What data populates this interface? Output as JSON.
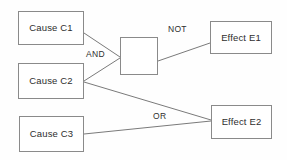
{
  "diagram": {
    "kind": "cause-effect-logic-diagram",
    "background_color": "#fefefe",
    "node_border_color": "#8a8a8a",
    "node_fill_color": "#ffffff",
    "edge_color": "#7a7a7a",
    "text_color": "#2e2e2e",
    "nodes": [
      {
        "id": "c1",
        "label": "Cause C1",
        "role": "cause",
        "x": 18,
        "y": 11,
        "w": 66,
        "h": 34
      },
      {
        "id": "c2",
        "label": "Cause C2",
        "role": "cause",
        "x": 18,
        "y": 63,
        "w": 66,
        "h": 36
      },
      {
        "id": "c3",
        "label": "Cause C3",
        "role": "cause",
        "x": 19,
        "y": 116,
        "w": 65,
        "h": 36
      },
      {
        "id": "gate",
        "label": "",
        "role": "gate",
        "x": 120,
        "y": 37,
        "w": 38,
        "h": 38
      },
      {
        "id": "e1",
        "label": "Effect E1",
        "role": "effect",
        "x": 210,
        "y": 21,
        "w": 62,
        "h": 33
      },
      {
        "id": "e2",
        "label": "Effect E2",
        "role": "effect",
        "x": 211,
        "y": 105,
        "w": 61,
        "h": 34
      }
    ],
    "edges": [
      {
        "id": "c1-gate",
        "from": "c1",
        "to": "gate",
        "x1": 84,
        "y1": 33,
        "x2": 120,
        "y2": 57
      },
      {
        "id": "c2-gate",
        "from": "c2",
        "to": "gate",
        "x1": 84,
        "y1": 81,
        "x2": 120,
        "y2": 58
      },
      {
        "id": "gate-e1",
        "from": "gate",
        "to": "e1",
        "x1": 158,
        "y1": 61,
        "x2": 210,
        "y2": 43
      },
      {
        "id": "c2-e2",
        "from": "c2",
        "to": "e2",
        "x1": 84,
        "y1": 82,
        "x2": 211,
        "y2": 120
      },
      {
        "id": "c3-e2",
        "from": "c3",
        "to": "e2",
        "x1": 84,
        "y1": 134,
        "x2": 211,
        "y2": 121
      }
    ],
    "edge_labels": [
      {
        "id": "and",
        "text": "AND",
        "x": 85,
        "y": 50
      },
      {
        "id": "not",
        "text": "NOT",
        "x": 167,
        "y": 25
      },
      {
        "id": "or",
        "text": "OR",
        "x": 152,
        "y": 112
      }
    ]
  }
}
